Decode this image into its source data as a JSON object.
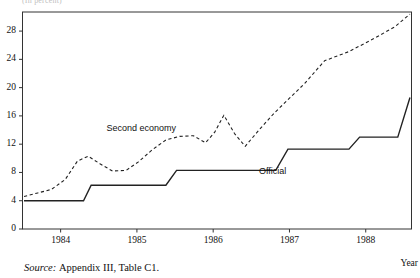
{
  "figure": {
    "clipped_title": "(In percent)",
    "source_prefix": "Source:",
    "source_text": "Appendix III, Table C1.",
    "x_axis_name": "Year"
  },
  "chart_data": {
    "type": "line",
    "title": "",
    "subtitle": "",
    "xlabel": "Year",
    "ylabel": "",
    "xlim": [
      1983.5,
      1988.6
    ],
    "ylim": [
      0,
      30.7
    ],
    "grid": false,
    "legend": "inline-annotations",
    "yticks": [
      0,
      4,
      8,
      12,
      16,
      20,
      24,
      28
    ],
    "xticks": [
      1984,
      1985,
      1986,
      1987,
      1988
    ],
    "xticklabels": [
      "1984",
      "1985",
      "1986",
      "1987",
      "1988"
    ],
    "annotations": [
      {
        "text": "Second economy",
        "x": 1984.6,
        "y": 14.1
      },
      {
        "text": "Official",
        "x": 1986.6,
        "y": 8.1
      }
    ],
    "series": [
      {
        "name": "Second economy",
        "style": "dashed",
        "color": "#222222",
        "x": [
          1983.52,
          1983.7,
          1983.88,
          1984.06,
          1984.22,
          1984.36,
          1984.52,
          1984.68,
          1984.86,
          1985.02,
          1985.2,
          1985.38,
          1985.56,
          1985.74,
          1985.9,
          1986.02,
          1986.14,
          1986.28,
          1986.42,
          1986.6,
          1986.8,
          1987.0,
          1987.2,
          1987.46,
          1987.78,
          1988.1,
          1988.38,
          1988.58
        ],
        "y": [
          4.6,
          5.1,
          5.6,
          7.0,
          9.6,
          10.3,
          9.2,
          8.2,
          8.3,
          9.5,
          11.2,
          12.6,
          13.1,
          13.2,
          12.2,
          13.7,
          16.1,
          13.5,
          11.7,
          14.0,
          16.4,
          18.5,
          20.6,
          23.8,
          25.1,
          26.9,
          28.6,
          30.4
        ]
      },
      {
        "name": "Official",
        "style": "solid",
        "color": "#222222",
        "x": [
          1983.52,
          1984.3,
          1984.4,
          1985.38,
          1985.52,
          1986.82,
          1986.98,
          1987.78,
          1987.92,
          1988.42,
          1988.58
        ],
        "y": [
          4.0,
          4.0,
          6.2,
          6.2,
          8.3,
          8.3,
          11.3,
          11.3,
          13.0,
          13.0,
          18.6
        ]
      }
    ]
  }
}
